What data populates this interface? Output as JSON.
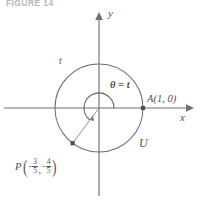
{
  "figure": {
    "caption": "FIGURE 14"
  },
  "axes": {
    "x_label": "x",
    "y_label": "y",
    "origin": {
      "x": 99,
      "y": 108
    },
    "x_arrow": "right-arrow-icon",
    "y_arrow": "up-arrow-icon"
  },
  "circle": {
    "name": "U",
    "label": "U",
    "radius_px": 44,
    "arc_label": "t",
    "center_label": null
  },
  "angle": {
    "label": "θ = t",
    "arc_radius_px": 15,
    "start_deg": 0,
    "end_deg": 233,
    "direction": "counterclockwise",
    "arrow": "arc-arrowhead-icon"
  },
  "points": [
    {
      "id": "A",
      "label": "A(1, 0)",
      "name": "point-a",
      "coords": {
        "x": 1,
        "y": 0
      },
      "px": {
        "x": 143,
        "y": 108
      }
    },
    {
      "id": "P",
      "label_var": "P",
      "name": "point-p",
      "coord_x": {
        "sign": "-",
        "numerator": "3",
        "denominator": "5"
      },
      "coord_y": {
        "sign": "-",
        "numerator": "4",
        "denominator": "5"
      },
      "px": {
        "x": 72.6,
        "y": 143.2
      }
    }
  ],
  "colors": {
    "stroke": "#6e6e6e",
    "axis": "#707070",
    "text": "#4f4f4f",
    "caption": "#b9b9b9",
    "background": "#ffffff"
  }
}
